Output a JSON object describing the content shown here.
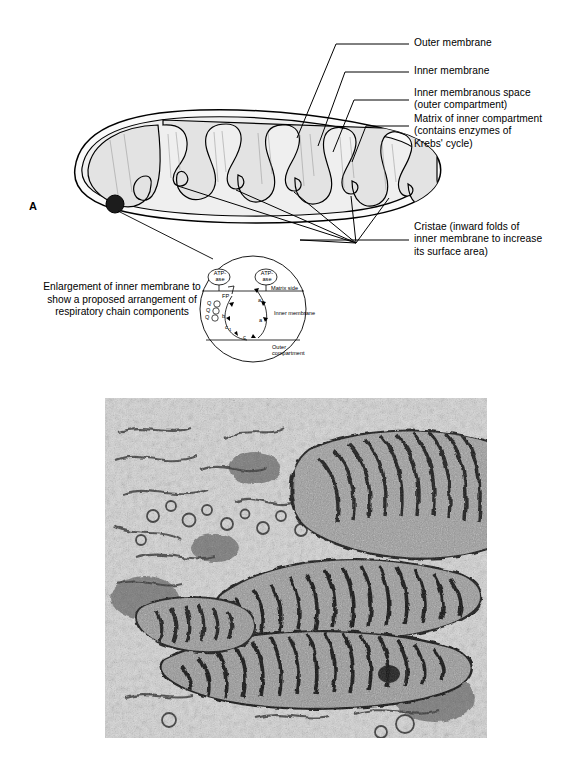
{
  "figure": {
    "panels": [
      {
        "letter": "A",
        "type": "line-diagram",
        "subject": "mitochondrion"
      },
      {
        "letter": "B",
        "type": "electron-micrograph",
        "subject": "mitochondria in cytoplasm"
      }
    ]
  },
  "panel_a": {
    "letter": "A",
    "callouts": [
      {
        "id": "outer-membrane",
        "text": "Outer membrane"
      },
      {
        "id": "inner-membrane",
        "text": "Inner membrane"
      },
      {
        "id": "inner-membranous-space",
        "text": "Inner membranous space\n(outer compartment)"
      },
      {
        "id": "matrix",
        "text": "Matrix of inner compartment\n(contains enzymes of\nKrebs' cycle)"
      },
      {
        "id": "cristae",
        "text": "Cristae (inward folds of\ninner membrane to increase\nits surface area)"
      }
    ],
    "enlargement_caption": "Enlargement of\ninner membrane to\nshow a proposed\narrangement of respiratory\nchain components",
    "inset": {
      "atpase_left": "ATP-\nase",
      "atpase_right": "ATP-\nase",
      "matrix_side": "Matrix side",
      "inner_membrane": "Inner membrane",
      "outer_compartment": "Outer\ncompartment",
      "chain_components": [
        {
          "id": "fp",
          "label": "FP"
        },
        {
          "id": "q1",
          "label": "Q"
        },
        {
          "id": "q2",
          "label": "Q"
        },
        {
          "id": "q3",
          "label": "Q"
        },
        {
          "id": "b",
          "label": "b"
        },
        {
          "id": "c1",
          "label": "c"
        },
        {
          "id": "c1sub",
          "label": "1"
        },
        {
          "id": "c",
          "label": "c"
        },
        {
          "id": "a",
          "label": "a"
        },
        {
          "id": "a3",
          "label": "a"
        },
        {
          "id": "a3sub",
          "label": "3"
        }
      ]
    }
  },
  "panel_b": {
    "letter": "B"
  },
  "colors": {
    "ink": "#000000",
    "matrix_fill": "#e3e3e3",
    "membrane_fill": "#f4f4f4",
    "granule": "#1a1a1a",
    "micrograph_base": "#d8d8d8",
    "micrograph_dark": "#232323"
  }
}
